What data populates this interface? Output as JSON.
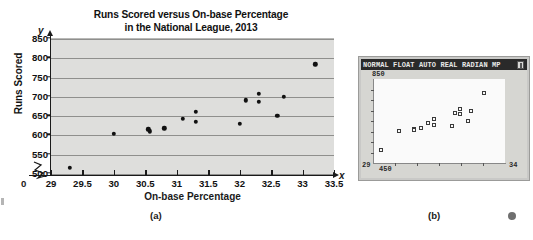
{
  "figure": {
    "caption_a": "(a)",
    "caption_b": "(b)"
  },
  "chart_data": {
    "type": "scatter",
    "title": "Runs Scored versus On-base Percentage in the National League, 2013",
    "title_line1": "Runs Scored versus On-base Percentage",
    "title_line2": "in the National League, 2013",
    "xlabel": "On-base Percentage",
    "ylabel": "Runs Scored",
    "x_var": "x",
    "y_var": "y",
    "origin_label": "0",
    "xlim": [
      29,
      33.5
    ],
    "ylim": [
      500,
      850
    ],
    "xticks": [
      29,
      29.5,
      30,
      30.5,
      31,
      31.5,
      32,
      32.5,
      33,
      33.5
    ],
    "xtick_labels": [
      "29",
      "29.5",
      "30",
      "30.5",
      "31",
      "31.5",
      "32",
      "32.5",
      "33",
      "33.5"
    ],
    "yticks": [
      500,
      550,
      600,
      650,
      700,
      750,
      800,
      850
    ],
    "ytick_labels": [
      "500",
      "550",
      "600",
      "650",
      "700",
      "750",
      "800",
      "850"
    ],
    "grid": "horizontal",
    "axis_break_x": true,
    "legend": "none",
    "marker": "filled-circle",
    "marker_color": "#111111",
    "plot_background": "#dededc",
    "points": [
      {
        "x": 29.3,
        "y": 513
      },
      {
        "x": 30.0,
        "y": 602
      },
      {
        "x": 30.55,
        "y": 613
      },
      {
        "x": 30.57,
        "y": 608
      },
      {
        "x": 30.8,
        "y": 616
      },
      {
        "x": 31.1,
        "y": 640
      },
      {
        "x": 31.3,
        "y": 658
      },
      {
        "x": 31.3,
        "y": 633
      },
      {
        "x": 32.0,
        "y": 627
      },
      {
        "x": 32.1,
        "y": 688
      },
      {
        "x": 32.3,
        "y": 706
      },
      {
        "x": 32.3,
        "y": 685
      },
      {
        "x": 32.6,
        "y": 648
      },
      {
        "x": 32.7,
        "y": 698
      },
      {
        "x": 33.2,
        "y": 782
      }
    ]
  },
  "calculator": {
    "status_bar": "NORMAL FLOAT AUTO REAL RADIAN MP",
    "battery_icon": "battery-icon",
    "window": {
      "ymax_label": "850",
      "ymin_label": "450",
      "xmin_label": "29",
      "xmax_label": "34"
    },
    "marker": "open-square",
    "points": [
      {
        "x": 29.3,
        "y": 513
      },
      {
        "x": 30.0,
        "y": 602
      },
      {
        "x": 30.55,
        "y": 613
      },
      {
        "x": 30.57,
        "y": 608
      },
      {
        "x": 30.8,
        "y": 616
      },
      {
        "x": 31.1,
        "y": 640
      },
      {
        "x": 31.3,
        "y": 658
      },
      {
        "x": 31.3,
        "y": 633
      },
      {
        "x": 32.0,
        "y": 627
      },
      {
        "x": 32.1,
        "y": 688
      },
      {
        "x": 32.3,
        "y": 706
      },
      {
        "x": 32.3,
        "y": 685
      },
      {
        "x": 32.6,
        "y": 648
      },
      {
        "x": 32.7,
        "y": 698
      },
      {
        "x": 33.2,
        "y": 782
      }
    ]
  }
}
